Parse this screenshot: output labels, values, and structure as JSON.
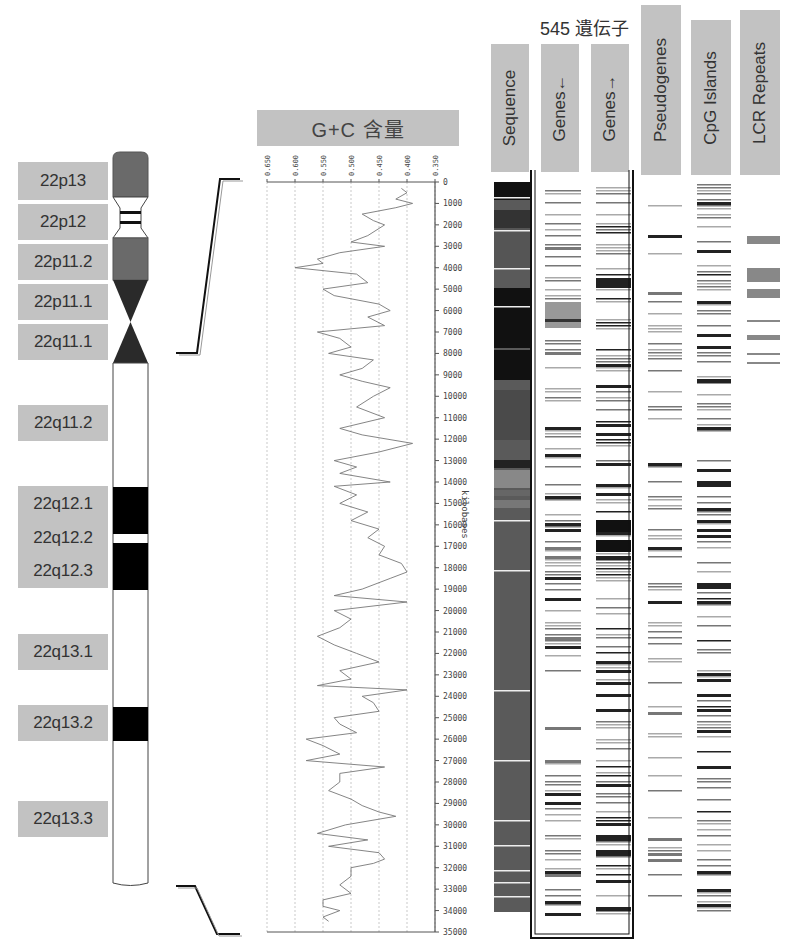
{
  "chromosome": {
    "name": "22",
    "bands": [
      {
        "label": "22p13",
        "top": 162,
        "height": 38
      },
      {
        "label": "22p12",
        "top": 204,
        "height": 36
      },
      {
        "label": "22p11.2",
        "top": 244,
        "height": 36
      },
      {
        "label": "22p11.1",
        "top": 284,
        "height": 36
      },
      {
        "label": "22q11.1",
        "top": 324,
        "height": 36
      },
      {
        "label": "22q11.2",
        "top": 405,
        "height": 36
      },
      {
        "label": "22q12.1",
        "top": 486,
        "height": 34
      },
      {
        "label": "22q12.2",
        "top": 520,
        "height": 34
      },
      {
        "label": "22q12.3",
        "top": 554,
        "height": 33
      },
      {
        "label": "22q13.1",
        "top": 634,
        "height": 36
      },
      {
        "label": "22q13.2",
        "top": 705,
        "height": 36
      },
      {
        "label": "22q13.3",
        "top": 801,
        "height": 36
      }
    ]
  },
  "gc_plot": {
    "title": "G+C 含量",
    "axis_label": "kilobases"
  },
  "tracks": {
    "gene_count_label": "545 遺伝子",
    "headers": [
      {
        "id": "sequence",
        "label": "Sequence"
      },
      {
        "id": "genes-reverse",
        "label": "Genes←"
      },
      {
        "id": "genes-forward",
        "label": "Genes→"
      },
      {
        "id": "pseudogenes",
        "label": "Pseudogenes"
      },
      {
        "id": "cpg-islands",
        "label": "CpG Islands"
      },
      {
        "id": "lcr-repeats",
        "label": "LCR Repeats"
      }
    ]
  },
  "chart_data": {
    "type": "line",
    "title": "G+C 含量",
    "xlabel": "G+C fraction",
    "ylabel": "kilobases",
    "x_axis_reversed": true,
    "xlim": [
      0.65,
      0.35
    ],
    "ylim": [
      0,
      35000
    ],
    "x_ticks": [
      "0.650",
      "0.600",
      "0.550",
      "0.500",
      "0.450",
      "0.400",
      "0.350"
    ],
    "y_ticks": [
      "0",
      "1000",
      "2000",
      "3000",
      "4000",
      "5000",
      "6000",
      "7000",
      "8000",
      "9000",
      "10000",
      "11000",
      "12000",
      "13000",
      "14000",
      "15000",
      "16000",
      "17000",
      "18000",
      "19000",
      "20000",
      "21000",
      "22000",
      "23000",
      "24000",
      "25000",
      "26000",
      "27000",
      "28000",
      "29000",
      "30000",
      "31000",
      "32000",
      "33000",
      "34000",
      "35000"
    ],
    "grid": true,
    "series": [
      {
        "name": "G+C content",
        "kb": [
          300,
          500,
          800,
          1000,
          1200,
          1500,
          1800,
          2000,
          2500,
          2800,
          3000,
          3300,
          3600,
          3800,
          4000,
          4300,
          4700,
          5000,
          5300,
          5700,
          6000,
          6300,
          6700,
          7000,
          7300,
          7700,
          8000,
          8300,
          8700,
          9000,
          9300,
          9600,
          10000,
          10500,
          11000,
          11500,
          11800,
          12200,
          12600,
          13000,
          13300,
          13600,
          14000,
          14200,
          14600,
          15000,
          15400,
          15800,
          16200,
          16600,
          17000,
          17400,
          17800,
          18200,
          18500,
          19000,
          19300,
          19600,
          20000,
          20400,
          20800,
          21200,
          21600,
          22000,
          22400,
          22800,
          23200,
          23500,
          23700,
          24000,
          24300,
          24700,
          25000,
          25300,
          25700,
          26000,
          26300,
          26700,
          27000,
          27300,
          27600,
          28000,
          28400,
          28800,
          29100,
          29400,
          29600,
          30000,
          30400,
          30700,
          31000,
          31300,
          31600,
          31800,
          32000,
          32400,
          32800,
          33200,
          33500,
          33800,
          34000,
          34300,
          34500
        ],
        "gc": [
          0.41,
          0.4,
          0.42,
          0.39,
          0.42,
          0.48,
          0.46,
          0.44,
          0.47,
          0.5,
          0.44,
          0.52,
          0.56,
          0.55,
          0.6,
          0.49,
          0.47,
          0.55,
          0.53,
          0.45,
          0.43,
          0.47,
          0.44,
          0.56,
          0.52,
          0.5,
          0.54,
          0.46,
          0.48,
          0.52,
          0.48,
          0.43,
          0.46,
          0.49,
          0.44,
          0.52,
          0.48,
          0.39,
          0.45,
          0.53,
          0.49,
          0.52,
          0.43,
          0.53,
          0.49,
          0.52,
          0.47,
          0.5,
          0.45,
          0.47,
          0.44,
          0.45,
          0.41,
          0.4,
          0.43,
          0.48,
          0.53,
          0.4,
          0.53,
          0.5,
          0.52,
          0.56,
          0.53,
          0.49,
          0.45,
          0.52,
          0.5,
          0.56,
          0.4,
          0.48,
          0.46,
          0.45,
          0.53,
          0.52,
          0.49,
          0.58,
          0.55,
          0.52,
          0.58,
          0.44,
          0.52,
          0.52,
          0.54,
          0.5,
          0.48,
          0.45,
          0.42,
          0.51,
          0.56,
          0.47,
          0.54,
          0.45,
          0.44,
          0.46,
          0.5,
          0.5,
          0.52,
          0.5,
          0.55,
          0.55,
          0.52,
          0.55,
          0.54
        ]
      }
    ]
  }
}
